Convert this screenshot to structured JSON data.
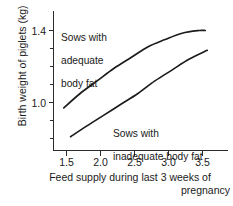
{
  "chart_data": {
    "type": "line",
    "title": "",
    "xlabel": "Feed supply during last 3 weeks of pregnancy",
    "xlabel_line1": "Feed supply during last 3 weeks of",
    "xlabel_line2": "pregnancy",
    "ylabel": "Birth weight of piglets (kg)",
    "xlim": [
      1.25,
      3.72
    ],
    "ylim": [
      0.72,
      1.48
    ],
    "xticks": [
      1.5,
      2.0,
      2.5,
      3.0,
      3.5
    ],
    "xtick_labels": [
      "1.5",
      "2.0",
      "2.5",
      "3.0",
      "3.5"
    ],
    "yticks": [
      1.0,
      1.4
    ],
    "ytick_labels": [
      "1.0",
      "1.4"
    ],
    "yminor_ticks": [
      0.8,
      0.9,
      1.1,
      1.2,
      1.3
    ],
    "grid": false,
    "legend_position": "inline-annotations",
    "line_color": "#1c1c1c",
    "axis_color": "#2b2b2b",
    "series": [
      {
        "name": "Sows with adequate body fat",
        "label_line1": "Sows with",
        "label_line2": "adequate",
        "label_line3": "body fat",
        "x": [
          1.46,
          1.7,
          1.95,
          2.2,
          2.45,
          2.7,
          2.95,
          3.2,
          3.45,
          3.54
        ],
        "values": [
          0.97,
          1.05,
          1.12,
          1.19,
          1.25,
          1.31,
          1.35,
          1.385,
          1.4,
          1.4
        ]
      },
      {
        "name": "Sows with inadequate body fat",
        "label_line1": "Sows with",
        "label_line2": "inadequate body fat",
        "x": [
          1.56,
          1.8,
          2.05,
          2.3,
          2.55,
          2.8,
          3.05,
          3.3,
          3.57
        ],
        "values": [
          0.81,
          0.87,
          0.93,
          0.99,
          1.05,
          1.12,
          1.18,
          1.24,
          1.29
        ]
      }
    ]
  }
}
